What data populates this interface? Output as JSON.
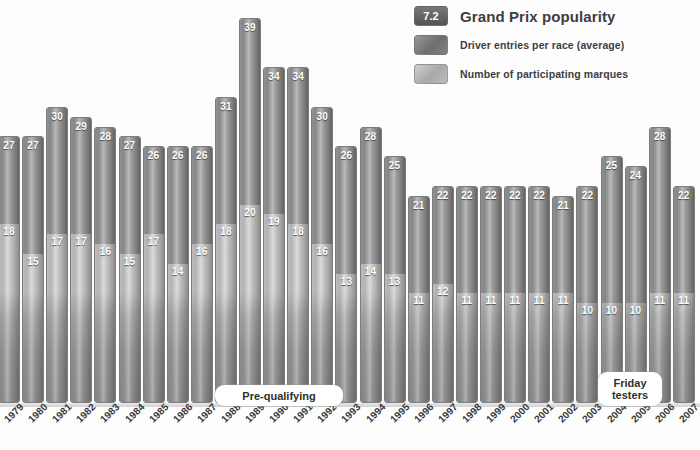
{
  "legend": {
    "badge": "7.2",
    "title": "Grand Prix popularity",
    "items": [
      {
        "swatch": "dark",
        "label": "Driver entries per race (average)"
      },
      {
        "swatch": "light",
        "label": "Number of participating marques"
      }
    ]
  },
  "annotations": [
    {
      "name": "pre-qualifying",
      "text": "Pre-qualifying"
    },
    {
      "name": "friday-testers",
      "text": "Friday testers"
    }
  ],
  "chart_data": {
    "type": "bar",
    "subtype": "stacked-overlay",
    "title": "Grand Prix popularity",
    "xlabel": "",
    "ylabel": "",
    "ylim": [
      0,
      39
    ],
    "grid": false,
    "legend_position": "top-right",
    "categories": [
      "1979",
      "1980",
      "1981",
      "1982",
      "1983",
      "1984",
      "1985",
      "1986",
      "1987",
      "1988",
      "1989",
      "1990",
      "1991",
      "1992",
      "1993",
      "1994",
      "1995",
      "1996",
      "1997",
      "1998",
      "1999",
      "2000",
      "2001",
      "2002",
      "2003",
      "2004",
      "2005",
      "2006",
      "2007"
    ],
    "series": [
      {
        "name": "Driver entries per race (average)",
        "values": [
          27,
          27,
          30,
          29,
          28,
          27,
          26,
          26,
          26,
          31,
          39,
          34,
          34,
          30,
          26,
          28,
          25,
          21,
          22,
          22,
          22,
          22,
          22,
          21,
          22,
          25,
          24,
          28,
          22
        ]
      },
      {
        "name": "Number of participating marques",
        "values": [
          18,
          15,
          17,
          17,
          16,
          15,
          17,
          14,
          16,
          18,
          20,
          19,
          18,
          16,
          13,
          14,
          13,
          11,
          12,
          11,
          11,
          11,
          11,
          11,
          10,
          10,
          10,
          11,
          11
        ]
      }
    ]
  }
}
